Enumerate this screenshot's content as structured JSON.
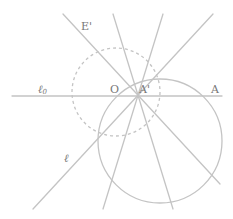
{
  "diagram": {
    "colors": {
      "stroke": "#c4c4c4",
      "label": "#777777",
      "background": "#ffffff"
    },
    "labels": {
      "E_prime": "E'",
      "O": "O",
      "A_prime": "A'",
      "A": "A",
      "l0_main": "ℓ",
      "l0_sub": "0",
      "l": "ℓ"
    },
    "elements": {
      "horizontal_line": "ℓ0",
      "pencil_of_lines_through": "A'",
      "dashed_circle": "circle centered at O",
      "solid_circle": "circle through A'"
    }
  }
}
